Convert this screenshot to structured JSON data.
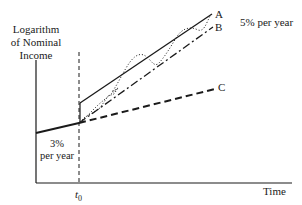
{
  "diagram": {
    "y_axis_label": [
      "Logarithm",
      "of Nominal",
      "Income"
    ],
    "x_axis_label": "Time",
    "t0_label": {
      "base": "t",
      "sub": "0"
    },
    "rate_before": [
      "3%",
      "per year"
    ],
    "rate_after": "5% per year",
    "lines": [
      {
        "id": "A",
        "label": "A",
        "style": "solid",
        "description": "immediate jump then 5% growth"
      },
      {
        "id": "B",
        "label": "B",
        "style": "dash-dot",
        "description": "gradual convergence to 5% growth path"
      },
      {
        "id": "C",
        "label": "C",
        "style": "dashed",
        "description": "continuation at 3% per year"
      }
    ],
    "oscillating_path": {
      "style": "dotted",
      "description": "cyclical adjustment around path A"
    },
    "colors": {
      "ink": "#1a1a1a",
      "background": "#ffffff"
    }
  }
}
